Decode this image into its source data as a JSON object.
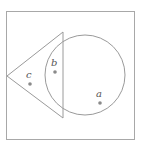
{
  "diagram": {
    "type": "venn-like",
    "colors": {
      "background": "#ffffff",
      "stroke": "#9a9a9a",
      "point": "#8a8a8a",
      "label": "#555555"
    },
    "frame": {
      "x": 6,
      "y": 11,
      "width": 128,
      "height": 128
    },
    "shapes": [
      {
        "name": "triangle",
        "points": [
          [
            7,
            76
          ],
          [
            63,
            32
          ],
          [
            63,
            118
          ]
        ]
      },
      {
        "name": "circle",
        "cx": 85,
        "cy": 75,
        "r": 40
      }
    ],
    "points": [
      {
        "label": "a",
        "x": 100,
        "y": 103,
        "label_x": 96,
        "label_y": 96
      },
      {
        "label": "b",
        "x": 55,
        "y": 72,
        "label_x": 51,
        "label_y": 65
      },
      {
        "label": "c",
        "x": 30,
        "y": 84,
        "label_x": 26,
        "label_y": 77
      }
    ]
  }
}
